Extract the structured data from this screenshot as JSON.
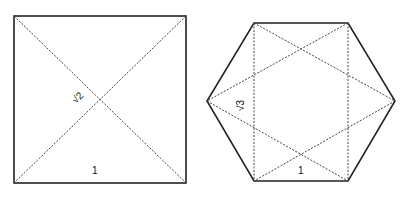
{
  "square": {
    "side_label": "1",
    "diagonal_label": "√2"
  },
  "hexagon": {
    "side_label": "1",
    "diagonal_label": "√3"
  }
}
